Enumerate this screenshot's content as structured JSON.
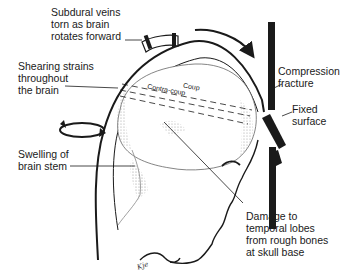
{
  "diagram": {
    "type": "medical-illustration",
    "labels": {
      "subdural": "Subdural veins\ntorn as brain\nrotates forward",
      "shearing": "Shearing strains\nthroughout\nthe brain",
      "swelling": "Swelling of\nbrain stem",
      "compression": "Compression\nfracture",
      "fixed": "Fixed\nsurface",
      "damage": "Damage to\ntemporal lobes\nfrom rough bones\nat skull base"
    },
    "inner_labels": {
      "coup": "Coup",
      "contra_coup": "Contra-coup"
    },
    "signature": "Kje",
    "colors": {
      "ink": "#1a1a1a",
      "shade": "#b8b8b8",
      "background": "#ffffff"
    }
  }
}
